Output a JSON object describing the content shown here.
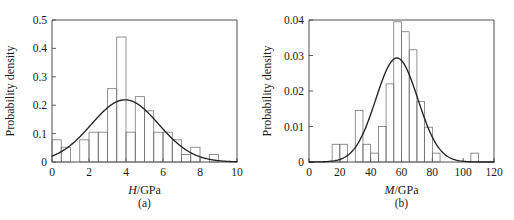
{
  "figure": {
    "panels": [
      {
        "caption": "(a)",
        "chart_data": {
          "type": "bar",
          "title": "",
          "xlabel_italic": "H",
          "xlabel_rest": "/GPa",
          "xlabel": "H/GPa",
          "ylabel": "Probability density",
          "xlim": [
            0,
            10
          ],
          "ylim": [
            0,
            0.5
          ],
          "xticks": [
            0,
            2,
            4,
            6,
            8,
            10
          ],
          "xticklabels": [
            "0",
            "2",
            "4",
            "6",
            "8",
            "10"
          ],
          "yticks": [
            0,
            0.1,
            0.2,
            0.3,
            0.4,
            0.5
          ],
          "yticklabels": [
            "0",
            "0.1",
            "0.2",
            "0.3",
            "0.4",
            "0.5"
          ],
          "grid": false,
          "legend": "none",
          "bin_width": 0.5,
          "bin_edges": [
            0,
            0.5,
            1.0,
            1.5,
            2.0,
            2.5,
            3.0,
            3.5,
            4.0,
            4.5,
            5.0,
            5.5,
            6.0,
            6.5,
            7.0,
            7.5,
            8.0,
            8.5,
            9.0,
            9.5,
            10.0
          ],
          "values": [
            0.078,
            0.052,
            0.0,
            0.078,
            0.105,
            0.105,
            0.258,
            0.44,
            0.105,
            0.23,
            0.18,
            0.105,
            0.105,
            0.078,
            0.026,
            0.052,
            0.0,
            0.026,
            0.0,
            0.0
          ],
          "curve": {
            "kind": "normal-fit",
            "mean": 3.95,
            "sigma": 1.82,
            "peak": 0.219
          }
        }
      },
      {
        "caption": "(b)",
        "chart_data": {
          "type": "bar",
          "title": "",
          "xlabel_italic": "M",
          "xlabel_rest": "/GPa",
          "xlabel": "M/GPa",
          "ylabel": "Probability density",
          "xlim": [
            0,
            120
          ],
          "ylim": [
            0,
            0.04
          ],
          "xticks": [
            0,
            20,
            40,
            60,
            80,
            100,
            120
          ],
          "xticklabels": [
            "0",
            "20",
            "40",
            "60",
            "80",
            "100",
            "120"
          ],
          "yticks": [
            0,
            0.01,
            0.02,
            0.03,
            0.04
          ],
          "yticklabels": [
            "0",
            "0.01",
            "0.02",
            "0.03",
            "0.04"
          ],
          "grid": false,
          "legend": "none",
          "bin_width": 5,
          "bin_edges": [
            0,
            5,
            10,
            15,
            20,
            25,
            30,
            35,
            40,
            45,
            50,
            55,
            60,
            65,
            70,
            75,
            80,
            85,
            90,
            95,
            100,
            105,
            110,
            115,
            120
          ],
          "values": [
            0.0,
            0.0,
            0.0,
            0.005,
            0.005,
            0.0,
            0.0145,
            0.005,
            0.0025,
            0.01,
            0.022,
            0.0395,
            0.0367,
            0.0316,
            0.017,
            0.0098,
            0.0025,
            0.0,
            0.0,
            0.0,
            0.0,
            0.0025,
            0.0,
            0.0
          ],
          "curve": {
            "kind": "normal-fit",
            "mean": 57.0,
            "sigma": 13.6,
            "peak": 0.0293
          }
        }
      }
    ]
  }
}
